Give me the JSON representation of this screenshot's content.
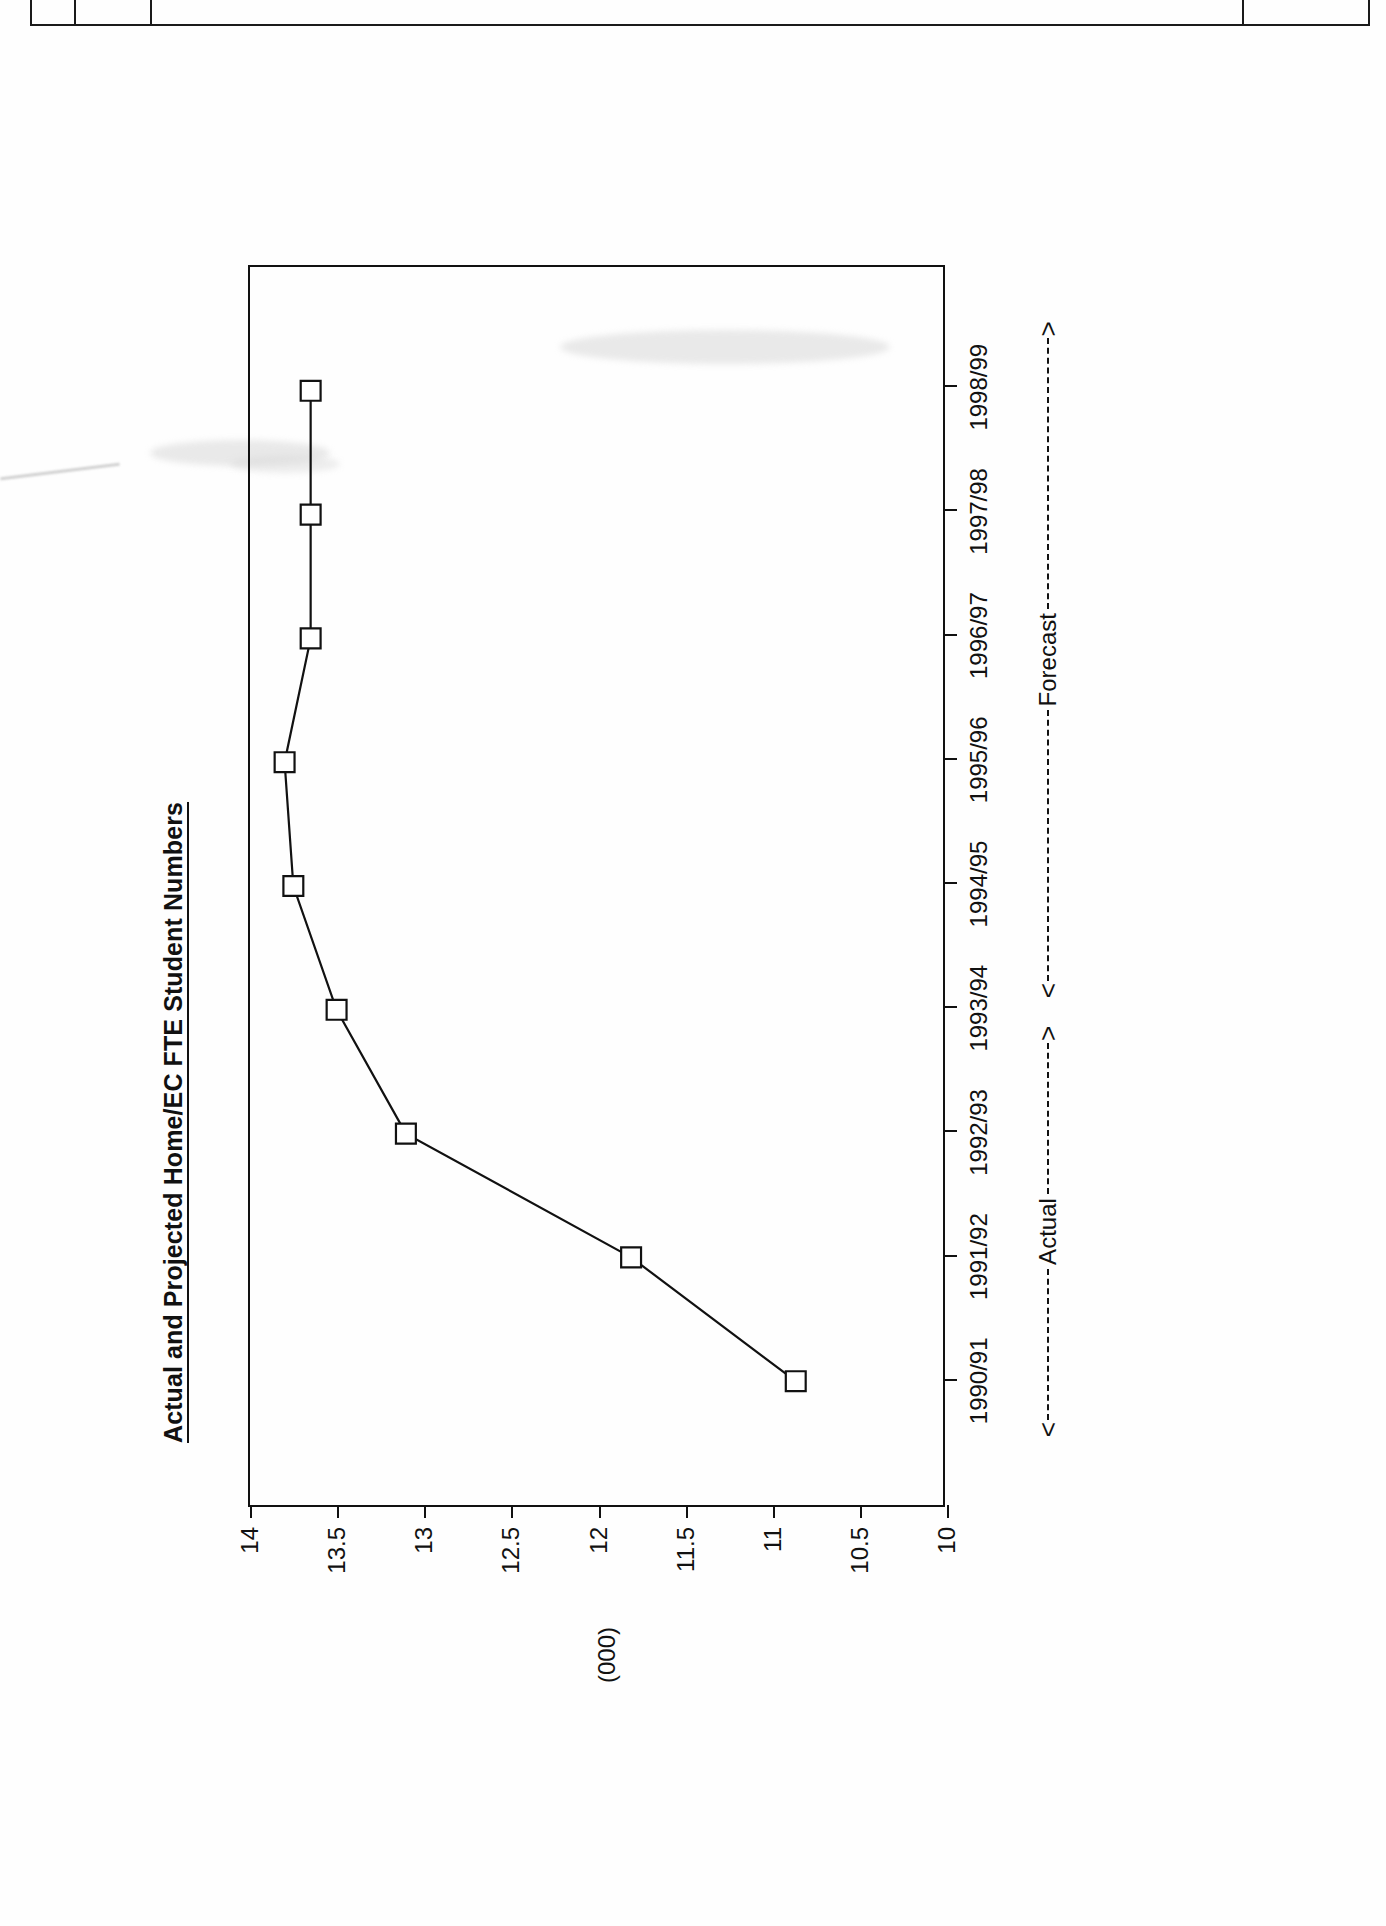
{
  "page": {
    "top_strip_text": "5."
  },
  "chart_data": {
    "type": "line",
    "title": "Actual and Projected Home/EC FTE Student Numbers",
    "xlabel": "",
    "ylabel": "(000)",
    "ylim": [
      10,
      14
    ],
    "yticks": [
      "14",
      "13.5",
      "13",
      "12.5",
      "12",
      "11.5",
      "11",
      "10.5",
      "10"
    ],
    "ytick_values": [
      14,
      13.5,
      13,
      12.5,
      12,
      11.5,
      11,
      10.5,
      10
    ],
    "grid": false,
    "legend": "none",
    "orientation": "rotated-90-ccw",
    "marker": "open-square",
    "categories": [
      "1990/91",
      "1991/92",
      "1992/93",
      "1993/94",
      "1994/95",
      "1995/96",
      "1996/97",
      "1997/98",
      "1998/99"
    ],
    "values": [
      10.85,
      11.8,
      13.1,
      13.5,
      13.75,
      13.8,
      13.65,
      13.65,
      13.65
    ],
    "annotations": [
      {
        "label": "Actual",
        "left_arrow": "<",
        "right_arrow": ">",
        "dash_style": "dashed",
        "span": [
          "1990/91",
          "1993/94"
        ]
      },
      {
        "label": "Forecast",
        "left_arrow": "<",
        "right_arrow": ">",
        "dash_style": "dashed",
        "span": [
          "1993/94",
          "1998/99"
        ]
      }
    ]
  }
}
